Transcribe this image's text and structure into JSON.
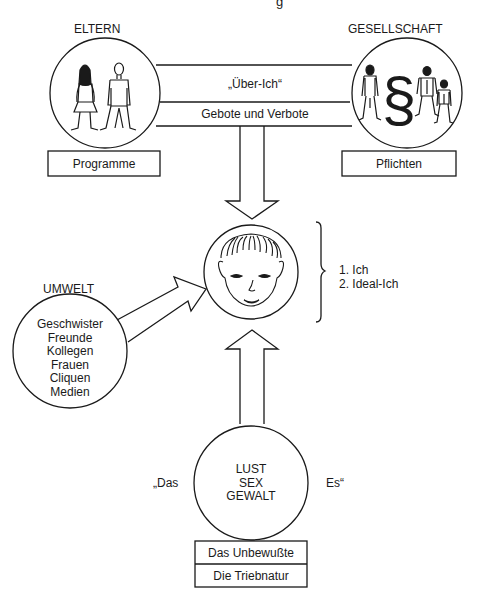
{
  "title_partial": "g",
  "parents": {
    "label": "ELTERN",
    "box": "Programme",
    "icon": "parents-figures-icon"
  },
  "society": {
    "label": "GESELLSCHAFT",
    "box": "Pflichten",
    "icon": "paragraph-section-icon",
    "symbol": "§"
  },
  "superego": {
    "title": "„Über-Ich“",
    "subtitle": "Gebote und Verbote"
  },
  "ego": {
    "icon": "child-face-icon",
    "items": [
      "1. Ich",
      "2. Ideal-Ich"
    ]
  },
  "environment": {
    "label": "UMWELT",
    "items": [
      "Geschwister",
      "Freunde",
      "Kollegen",
      "Frauen",
      "Cliquen",
      "Medien"
    ]
  },
  "id": {
    "left_quote": "„Das",
    "right_quote": "Es“",
    "items": [
      "LUST",
      "SEX",
      "GEWALT"
    ],
    "box_top": "Das Unbewußte",
    "box_bottom": "Die Triebnatur"
  },
  "colors": {
    "line": "#1a1a1a",
    "background": "#ffffff"
  }
}
